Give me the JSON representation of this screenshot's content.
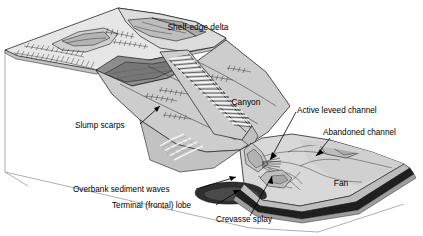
{
  "figure": {
    "kind": "block-diagram",
    "background_color": "#ffffff",
    "line_color": "#000000"
  },
  "terrain_labels": [
    {
      "id": "shelf-edge-delta",
      "text": "Shelf-edge delta",
      "x": 198,
      "y": 30,
      "anchor": "middle"
    },
    {
      "id": "canyon",
      "text": "Canyon",
      "x": 246,
      "y": 105,
      "anchor": "middle"
    },
    {
      "id": "fan",
      "text": "Fan",
      "x": 341,
      "y": 186,
      "anchor": "middle"
    }
  ],
  "annotation_labels": [
    {
      "id": "slump-scarps",
      "text": "Slump scarps",
      "x": 75,
      "y": 128,
      "anchor": "start"
    },
    {
      "id": "active-leveed-channel",
      "text": "Active leveed channel",
      "x": 297,
      "y": 113,
      "anchor": "start"
    },
    {
      "id": "abandoned-channel",
      "text": "Abandoned channel",
      "x": 323,
      "y": 135,
      "anchor": "start"
    },
    {
      "id": "overbank-sediment-waves",
      "text": "Overbank sediment waves",
      "x": 73,
      "y": 192,
      "anchor": "start"
    },
    {
      "id": "terminal-frontal-lobe",
      "text": "Terminal (frontal) lobe",
      "x": 112,
      "y": 208,
      "anchor": "start"
    },
    {
      "id": "crevasse-splay",
      "text": "Crevasse splay",
      "x": 216,
      "y": 222,
      "anchor": "start"
    }
  ],
  "palette": {
    "shelf_top": "#e3e3e3",
    "shelf_top_2": "#d9d9d9",
    "delta_plain": "#c9c9c9",
    "delta_front_dark": "#8e8e8e",
    "delta_front_darker": "#7a7a7a",
    "slope_upper": "#d2d2d2",
    "slope_mid": "#c4c4c4",
    "slope_lower": "#bdbdbd",
    "canyon_fill": "#cfcfcf",
    "canyon_hachure": "#ffffff",
    "fan_surface": "#d6d6d6",
    "fan_surface_2": "#cccccc",
    "lobe_dark": "#2a2a2a",
    "block_edge_dark": "#1c1c1c",
    "block_edge_mid": "#b6b6b6",
    "frame_line": "#8d8d8d",
    "label_text": "#000000"
  }
}
